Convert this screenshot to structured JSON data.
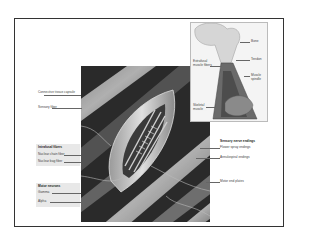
{
  "figure": {
    "main_illustration": "Cutaway of muscle spindle within skeletal muscle fibers",
    "inset_illustration": "Bone, tendon and muscle showing spindle location"
  },
  "labels_left": {
    "capsule": "Connective tissue capsule",
    "sensory_fiber": "Sensory fiber",
    "intrafusal_heading": "Intrafusal fibers",
    "nuclear_chain": "Nuclear chain fiber",
    "nuclear_bag": "Nuclear bag fiber",
    "motor_heading": "Motor neurons",
    "gamma": "Gamma",
    "alpha": "Alpha"
  },
  "labels_right": {
    "sensory_heading": "Sensory nerve endings",
    "flower_spray": "Flower spray endings",
    "annulospiral": "Annulospiral endings",
    "motor_end_plates": "Motor end plates"
  },
  "labels_inset": {
    "bone": "Bone",
    "tendon": "Tendon",
    "extrafusal": "Extrafusal muscle fibers",
    "muscle_spindle": "Muscle spindle",
    "skeletal_muscle": "Skeletal muscle"
  },
  "colors": {
    "frame": "#333333",
    "illustration_dark": "#2e2e2e",
    "inset_bg": "#f3f3f3",
    "label_text": "#444444"
  }
}
